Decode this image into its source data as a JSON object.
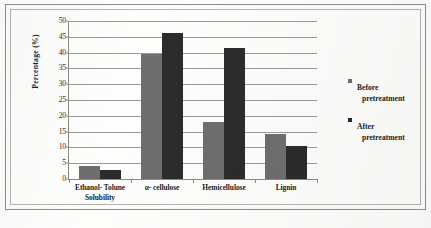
{
  "chart_data": {
    "type": "bar",
    "title": "",
    "xlabel": "",
    "ylabel": "Percentage (%)",
    "ylim": [
      0,
      50
    ],
    "ytick_step": 5,
    "yticks": [
      "0",
      "5",
      "10",
      "15",
      "20",
      "25",
      "30",
      "35",
      "40",
      "45",
      "50"
    ],
    "grid": true,
    "legend_position": "right",
    "categories": [
      "Ethanol- Tolune Solubility",
      "α- cellulose",
      "Hemicellulose",
      "Lignin"
    ],
    "category_lines": [
      [
        "Ethanol- Tolune",
        "Solubility"
      ],
      [
        "α- cellulose"
      ],
      [
        "Hemicellulose"
      ],
      [
        "Lignin"
      ]
    ],
    "series": [
      {
        "name": "Before pretreatment",
        "color": "#6f6e6e",
        "values": [
          4.0,
          39.5,
          18.2,
          14.3
        ]
      },
      {
        "name": "After pretreatment",
        "color": "#2c2b2b",
        "values": [
          2.9,
          46.1,
          41.5,
          10.3
        ]
      }
    ]
  },
  "legend": {
    "entries": [
      {
        "line1": "Before",
        "line2": "pretreatment",
        "swatch": "before"
      },
      {
        "line1": "After",
        "line2": "pretreatment",
        "swatch": "after"
      }
    ]
  },
  "colors": {
    "series_before": "#6f6e6e",
    "series_after": "#2c2b2b",
    "gridline": "#9a9a9a",
    "axis": "#8c8a88",
    "outer_frame": "#8e8e8e",
    "inner_frame": "#b4b2b0",
    "background": "#fdfdfc"
  }
}
